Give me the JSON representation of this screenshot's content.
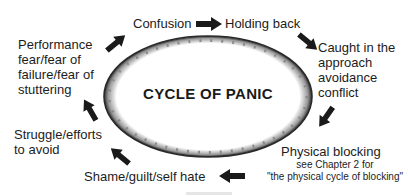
{
  "diagram": {
    "center": "CYCLE OF PANIC",
    "nodes": [
      {
        "id": "confusion",
        "lines": [
          "Confusion"
        ]
      },
      {
        "id": "holding-back",
        "lines": [
          "Holding back"
        ]
      },
      {
        "id": "caught",
        "lines": [
          "Caught in the",
          "approach",
          "avoidance",
          "conflict"
        ]
      },
      {
        "id": "physical-blocking",
        "lines": [
          "Physical blocking"
        ],
        "note": [
          "see Chapter 2 for",
          "\"the physical cycle of blocking\""
        ]
      },
      {
        "id": "shame",
        "lines": [
          "Shame/guilt/self hate"
        ]
      },
      {
        "id": "struggle",
        "lines": [
          "Struggle/efforts",
          "to avoid"
        ]
      },
      {
        "id": "performance-fear",
        "lines": [
          "Performance",
          "fear/fear of",
          "failure/fear of",
          "stuttering"
        ]
      }
    ],
    "colors": {
      "arrow": "#1a1a1a",
      "ellipse_border": "#2a2a2a",
      "text": "#1c1c1c"
    }
  }
}
